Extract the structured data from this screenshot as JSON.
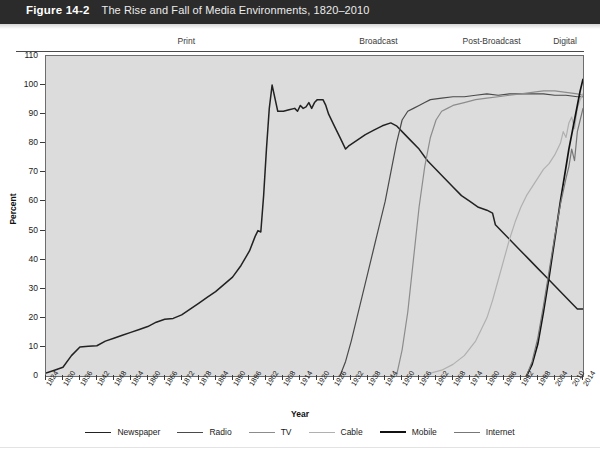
{
  "header": {
    "figure_number": "Figure 14-2",
    "title": "The Rise and Fall of Media Environments, 1820–2010"
  },
  "eras": [
    {
      "label": "Print",
      "year": 1874
    },
    {
      "label": "Broadcast",
      "year": 1942
    },
    {
      "label": "Post-Broadcast",
      "year": 1982
    },
    {
      "label": "Digital",
      "year": 2008
    }
  ],
  "chart_data": {
    "type": "line",
    "title": "The Rise and Fall of Media Environments, 1820–2010",
    "xlabel": "Year",
    "ylabel": "Percent",
    "xlim": [
      1824,
      2014
    ],
    "ylim": [
      0,
      110
    ],
    "yticks": [
      0,
      10,
      20,
      30,
      40,
      50,
      60,
      70,
      80,
      90,
      100,
      110
    ],
    "xticks": [
      1824,
      1830,
      1836,
      1842,
      1848,
      1854,
      1860,
      1866,
      1872,
      1878,
      1884,
      1890,
      1896,
      1902,
      1908,
      1914,
      1920,
      1926,
      1932,
      1938,
      1944,
      1950,
      1956,
      1962,
      1968,
      1974,
      1980,
      1986,
      1992,
      1998,
      2004,
      2010,
      2014
    ],
    "grid": "horizontal-bands",
    "legend_position": "bottom",
    "series": [
      {
        "name": "Newspaper",
        "color": "#222222",
        "width": 1.5,
        "points": [
          [
            1824,
            1
          ],
          [
            1827,
            2
          ],
          [
            1830,
            3
          ],
          [
            1833,
            7
          ],
          [
            1836,
            10
          ],
          [
            1839,
            10.2
          ],
          [
            1842,
            10.4
          ],
          [
            1845,
            12
          ],
          [
            1848,
            13
          ],
          [
            1851,
            14
          ],
          [
            1854,
            15
          ],
          [
            1857,
            16
          ],
          [
            1860,
            17
          ],
          [
            1863,
            18.5
          ],
          [
            1866,
            19.5
          ],
          [
            1869,
            19.8
          ],
          [
            1872,
            21
          ],
          [
            1875,
            23
          ],
          [
            1878,
            25
          ],
          [
            1881,
            27
          ],
          [
            1884,
            29
          ],
          [
            1887,
            31.5
          ],
          [
            1890,
            34
          ],
          [
            1893,
            38
          ],
          [
            1896,
            43
          ],
          [
            1898,
            48
          ],
          [
            1899,
            50
          ],
          [
            1900,
            49.5
          ],
          [
            1901,
            62
          ],
          [
            1902,
            78
          ],
          [
            1903,
            92
          ],
          [
            1904,
            100
          ],
          [
            1906,
            91
          ],
          [
            1908,
            91
          ],
          [
            1910,
            91.5
          ],
          [
            1912,
            92
          ],
          [
            1913,
            91
          ],
          [
            1914,
            93
          ],
          [
            1915,
            92
          ],
          [
            1916,
            92.5
          ],
          [
            1917,
            94
          ],
          [
            1918,
            92
          ],
          [
            1919,
            94
          ],
          [
            1920,
            95
          ],
          [
            1921,
            95
          ],
          [
            1922,
            95
          ],
          [
            1923,
            93
          ],
          [
            1924,
            90
          ],
          [
            1926,
            86
          ],
          [
            1928,
            82
          ],
          [
            1930,
            78
          ],
          [
            1931,
            79
          ],
          [
            1934,
            81
          ],
          [
            1937,
            83
          ],
          [
            1940,
            84.5
          ],
          [
            1943,
            86
          ],
          [
            1946,
            87
          ],
          [
            1948,
            86
          ],
          [
            1950,
            84
          ],
          [
            1953,
            81
          ],
          [
            1956,
            78
          ],
          [
            1959,
            74
          ],
          [
            1962,
            71
          ],
          [
            1965,
            68
          ],
          [
            1968,
            65
          ],
          [
            1971,
            62
          ],
          [
            1974,
            60
          ],
          [
            1977,
            58
          ],
          [
            1980,
            57
          ],
          [
            1982,
            56
          ],
          [
            1983,
            52
          ],
          [
            1986,
            49
          ],
          [
            1989,
            46
          ],
          [
            1992,
            43
          ],
          [
            1995,
            40
          ],
          [
            1998,
            37
          ],
          [
            2001,
            34
          ],
          [
            2004,
            31
          ],
          [
            2007,
            28
          ],
          [
            2010,
            25
          ],
          [
            2012,
            23
          ],
          [
            2014,
            23
          ]
        ]
      },
      {
        "name": "Radio",
        "color": "#4a4a4a",
        "width": 1.2,
        "points": [
          [
            1928,
            0
          ],
          [
            1930,
            5
          ],
          [
            1932,
            12
          ],
          [
            1934,
            20
          ],
          [
            1936,
            28
          ],
          [
            1938,
            36
          ],
          [
            1940,
            44
          ],
          [
            1942,
            52
          ],
          [
            1944,
            60
          ],
          [
            1946,
            70
          ],
          [
            1948,
            80
          ],
          [
            1950,
            88
          ],
          [
            1952,
            91
          ],
          [
            1954,
            92
          ],
          [
            1956,
            93
          ],
          [
            1958,
            94
          ],
          [
            1960,
            95
          ],
          [
            1964,
            95.5
          ],
          [
            1968,
            96
          ],
          [
            1972,
            96
          ],
          [
            1976,
            96.5
          ],
          [
            1980,
            97
          ],
          [
            1984,
            96.5
          ],
          [
            1988,
            97
          ],
          [
            1992,
            97
          ],
          [
            1996,
            97
          ],
          [
            2000,
            97
          ],
          [
            2004,
            96.5
          ],
          [
            2008,
            96.5
          ],
          [
            2012,
            96
          ],
          [
            2014,
            96
          ]
        ]
      },
      {
        "name": "TV",
        "color": "#8c8c8c",
        "width": 1.2,
        "points": [
          [
            1948,
            0
          ],
          [
            1950,
            9
          ],
          [
            1952,
            22
          ],
          [
            1954,
            40
          ],
          [
            1956,
            58
          ],
          [
            1958,
            72
          ],
          [
            1960,
            82
          ],
          [
            1962,
            88
          ],
          [
            1964,
            91
          ],
          [
            1966,
            92
          ],
          [
            1968,
            93
          ],
          [
            1972,
            94
          ],
          [
            1976,
            95
          ],
          [
            1980,
            95.5
          ],
          [
            1984,
            96
          ],
          [
            1988,
            96.5
          ],
          [
            1992,
            97
          ],
          [
            1996,
            97.5
          ],
          [
            2000,
            98
          ],
          [
            2004,
            98
          ],
          [
            2008,
            97.5
          ],
          [
            2012,
            97
          ],
          [
            2014,
            96.5
          ]
        ]
      },
      {
        "name": "Cable",
        "color": "#b0b0b0",
        "width": 1.2,
        "points": [
          [
            1960,
            1
          ],
          [
            1964,
            2
          ],
          [
            1968,
            4
          ],
          [
            1972,
            7
          ],
          [
            1976,
            12
          ],
          [
            1978,
            16
          ],
          [
            1980,
            20
          ],
          [
            1982,
            26
          ],
          [
            1984,
            33
          ],
          [
            1986,
            40
          ],
          [
            1988,
            47
          ],
          [
            1990,
            53
          ],
          [
            1992,
            58
          ],
          [
            1994,
            62
          ],
          [
            1996,
            65
          ],
          [
            1998,
            68
          ],
          [
            2000,
            71
          ],
          [
            2002,
            73
          ],
          [
            2004,
            76
          ],
          [
            2006,
            80
          ],
          [
            2007,
            84
          ],
          [
            2008,
            82
          ],
          [
            2009,
            87
          ],
          [
            2010,
            89
          ],
          [
            2011,
            85
          ],
          [
            2012,
            92
          ],
          [
            2013,
            95
          ],
          [
            2014,
            97
          ]
        ]
      },
      {
        "name": "Mobile",
        "color": "#111111",
        "width": 1.7,
        "points": [
          [
            1994,
            0
          ],
          [
            1996,
            4
          ],
          [
            1998,
            11
          ],
          [
            2000,
            22
          ],
          [
            2002,
            34
          ],
          [
            2004,
            47
          ],
          [
            2006,
            60
          ],
          [
            2008,
            72
          ],
          [
            2009,
            78
          ],
          [
            2010,
            83
          ],
          [
            2011,
            88
          ],
          [
            2012,
            93
          ],
          [
            2013,
            98
          ],
          [
            2014,
            102
          ]
        ]
      },
      {
        "name": "Internet",
        "color": "#777777",
        "width": 1.2,
        "points": [
          [
            1994,
            0
          ],
          [
            1996,
            5
          ],
          [
            1998,
            13
          ],
          [
            2000,
            24
          ],
          [
            2002,
            36
          ],
          [
            2004,
            48
          ],
          [
            2006,
            59
          ],
          [
            2008,
            68
          ],
          [
            2009,
            72
          ],
          [
            2010,
            78
          ],
          [
            2011,
            74
          ],
          [
            2012,
            84
          ],
          [
            2013,
            88
          ],
          [
            2014,
            92
          ]
        ]
      }
    ]
  },
  "legend": [
    {
      "label": "Newspaper",
      "color": "#222222",
      "width": 1.8
    },
    {
      "label": "Radio",
      "color": "#4a4a4a",
      "width": 1.5
    },
    {
      "label": "TV",
      "color": "#8c8c8c",
      "width": 1.4
    },
    {
      "label": "Cable",
      "color": "#b0b0b0",
      "width": 1.4
    },
    {
      "label": "Mobile",
      "color": "#111111",
      "width": 2.0
    },
    {
      "label": "Internet",
      "color": "#777777",
      "width": 1.4
    }
  ]
}
